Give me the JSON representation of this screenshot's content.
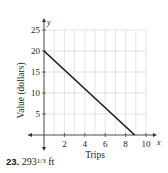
{
  "chart_data": {
    "type": "line",
    "title": "",
    "xlabel": "Trips",
    "ylabel": "Value (dollars)",
    "x_axis_symbol": "x",
    "y_axis_symbol": "y",
    "xlim": [
      0,
      10
    ],
    "ylim": [
      0,
      25
    ],
    "x_ticks": [
      2,
      4,
      6,
      8,
      10
    ],
    "y_ticks": [
      5,
      10,
      15,
      20,
      25
    ],
    "grid": true,
    "grid_x_step": 1,
    "grid_y_step": 5,
    "series": [
      {
        "name": "Value",
        "x": [
          0,
          8.89
        ],
        "y": [
          20,
          0
        ],
        "color": "#1a1a1a"
      }
    ]
  },
  "caption": {
    "number": "23.",
    "whole": "293",
    "fraction": "1/3",
    "unit": "ft"
  },
  "colors": {
    "grid": "#d0d0d0",
    "axis": "#333333",
    "line": "#1a1a1a"
  }
}
